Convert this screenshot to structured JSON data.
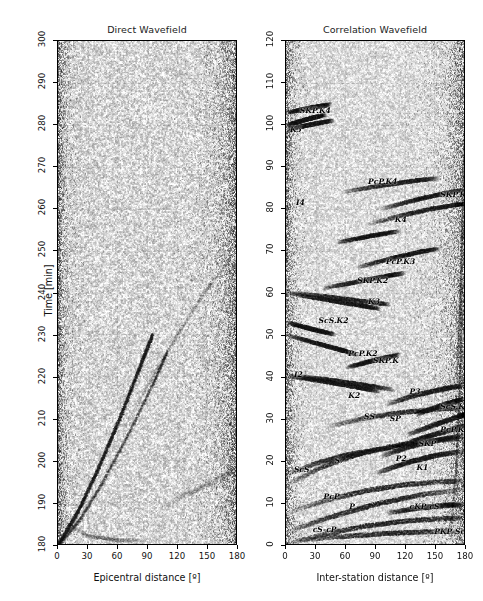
{
  "figure": {
    "width": 483,
    "height": 601,
    "background": "#ffffff"
  },
  "panels": [
    {
      "id": "direct-wavefield",
      "title": "Direct Wavefield",
      "xlabel": "Epicentral distance [º]",
      "ylabel": "Time [min]",
      "xlim": [
        0,
        180
      ],
      "ylim": [
        180,
        300
      ],
      "xticks": [
        0,
        30,
        60,
        90,
        120,
        150,
        180
      ],
      "yticks": [
        180,
        190,
        200,
        210,
        220,
        230,
        240,
        250,
        260,
        270,
        280,
        290,
        300
      ],
      "grid": true,
      "phases": []
    },
    {
      "id": "correlation-wavefield",
      "title": "Correlation Wavefield",
      "xlabel": "Inter-station distance [º]",
      "ylabel": "",
      "xlim": [
        0,
        180
      ],
      "ylim": [
        0,
        120
      ],
      "xticks": [
        0,
        30,
        60,
        90,
        120,
        150,
        180
      ],
      "yticks": [
        0,
        10,
        20,
        30,
        40,
        50,
        60,
        70,
        80,
        90,
        100,
        110,
        120
      ],
      "grid": true,
      "phases": [
        {
          "label": "SKP.K4",
          "x": 14,
          "y": 103.5
        },
        {
          "label": "K5",
          "x": 4,
          "y": 99.0
        },
        {
          "label": "PcP.K4",
          "x": 83,
          "y": 86.5
        },
        {
          "label": "I4",
          "x": 10,
          "y": 81.5
        },
        {
          "label": "SKP.K4",
          "x": 156,
          "y": 83.5
        },
        {
          "label": "K4",
          "x": 110,
          "y": 77.5
        },
        {
          "label": "PcP.K3",
          "x": 101,
          "y": 67.5
        },
        {
          "label": "SKP.K2",
          "x": 72,
          "y": 63.0
        },
        {
          "label": "K3",
          "x": 83,
          "y": 58.0
        },
        {
          "label": "ScS.K2",
          "x": 33,
          "y": 53.5
        },
        {
          "label": "PcP.K2",
          "x": 63,
          "y": 45.5
        },
        {
          "label": "SKP.K",
          "x": 88,
          "y": 44.0
        },
        {
          "label": "I2",
          "x": 8,
          "y": 40.5
        },
        {
          "label": "K2",
          "x": 63,
          "y": 35.5
        },
        {
          "label": "P3",
          "x": 125,
          "y": 36.5
        },
        {
          "label": "ScS.K",
          "x": 156,
          "y": 33.0
        },
        {
          "label": "SS",
          "x": 79,
          "y": 30.5
        },
        {
          "label": "SP",
          "x": 105,
          "y": 30.0
        },
        {
          "label": "PcP.K",
          "x": 156,
          "y": 27.5
        },
        {
          "label": "SKP",
          "x": 134,
          "y": 24.0
        },
        {
          "label": "P2",
          "x": 111,
          "y": 20.5
        },
        {
          "label": "K1",
          "x": 132,
          "y": 18.5
        },
        {
          "label": "ScS",
          "x": 8,
          "y": 18.0
        },
        {
          "label": "S",
          "x": 49,
          "y": 20.0
        },
        {
          "label": "PcP",
          "x": 38,
          "y": 11.5
        },
        {
          "label": "P",
          "x": 64,
          "y": 9.0
        },
        {
          "label": "cKP-cS",
          "x": 125,
          "y": 9.0
        },
        {
          "label": "cS-cP",
          "x": 27,
          "y": 3.5
        },
        {
          "label": "PKP-ScS",
          "x": 150,
          "y": 3.0
        }
      ]
    }
  ],
  "style": {
    "axis_color": "#000000",
    "grid_color": "#9a9a9a",
    "plot_background": "#f2f2f2",
    "text_color": "#111111"
  }
}
